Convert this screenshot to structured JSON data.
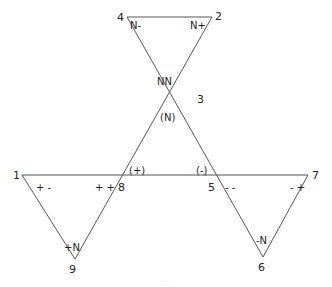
{
  "diagram": {
    "stroke_color": "#555555",
    "nodes": [
      {
        "id": "1",
        "x": 22,
        "y": 175
      },
      {
        "id": "2",
        "x": 212,
        "y": 17
      },
      {
        "id": "3",
        "x": 191,
        "y": 96
      },
      {
        "id": "4",
        "x": 127,
        "y": 17
      },
      {
        "id": "5",
        "x": 217,
        "y": 175
      },
      {
        "id": "6",
        "x": 263,
        "y": 257
      },
      {
        "id": "7",
        "x": 308,
        "y": 175
      },
      {
        "id": "8",
        "x": 120,
        "y": 175
      },
      {
        "id": "9",
        "x": 75,
        "y": 259
      }
    ],
    "node_labels": {
      "n1": "1",
      "n2": "2",
      "n3": "3",
      "n4": "4",
      "n5": "5",
      "n6": "6",
      "n7": "7",
      "n8": "8",
      "n9": "9"
    },
    "edge_labels": {
      "n_minus": "N-",
      "n_plus": "N+",
      "nn": "NN",
      "paren_n": "(N)",
      "paren_plus": "(+)",
      "paren_minus": "(-)",
      "plus_minus": "+ -",
      "plus_plus": "+ +",
      "minus_minus": "- -",
      "minus_plus": "- +",
      "plus_n": "+N",
      "minus_n": "-N"
    },
    "caption": "..."
  }
}
